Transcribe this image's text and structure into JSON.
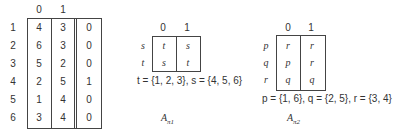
{
  "table_main": {
    "col_headers": [
      "0",
      "1"
    ],
    "row_labels": [
      "1",
      "2",
      "3",
      "4",
      "5",
      "6"
    ],
    "rows": [
      [
        "4",
        "3",
        "0"
      ],
      [
        "6",
        "3",
        "0"
      ],
      [
        "5",
        "2",
        "0"
      ],
      [
        "2",
        "5",
        "1"
      ],
      [
        "1",
        "4",
        "0"
      ],
      [
        "3",
        "4",
        "0"
      ]
    ]
  },
  "table_pi1": {
    "col_headers": [
      "0",
      "1"
    ],
    "row_labels": [
      "s",
      "t"
    ],
    "rows": [
      [
        "t",
        "s"
      ],
      [
        "s",
        "t"
      ]
    ],
    "legend": "t = {1, 2, 3},  s = {4, 5, 6}",
    "caption_main": "A",
    "caption_sub": "π1"
  },
  "table_pi2": {
    "col_headers": [
      "0",
      "1"
    ],
    "row_labels": [
      "p",
      "q",
      "r"
    ],
    "rows": [
      [
        "r",
        "r"
      ],
      [
        "p",
        "r"
      ],
      [
        "q",
        "q"
      ]
    ],
    "legend": "p = {1, 6},  q = {2, 5},  r = {3, 4}",
    "caption_main": "A",
    "caption_sub": "π2"
  }
}
